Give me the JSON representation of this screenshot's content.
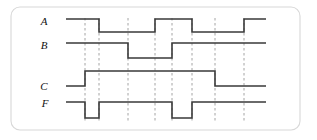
{
  "figure": {
    "frame": {
      "x": 11,
      "y": 7,
      "width": 289,
      "height": 123,
      "radius": 9,
      "border_color": "#d8d8d8",
      "fill": "#ffffff"
    },
    "waveform_color": "#3a3a3a",
    "marker_color": "#9a9a9a",
    "label_color": "#111111",
    "time_start": 66,
    "time_end": 266
  },
  "chart_data": {
    "type": "line",
    "xlabel": "time",
    "ylabel": "",
    "grid": "vertical-dashed-markers",
    "legend_position": "left-labels",
    "marker_times": [
      85,
      99,
      128,
      155,
      172,
      192,
      215,
      244
    ],
    "marker_span_y": [
      18,
      122
    ],
    "signals": [
      {
        "name": "A",
        "label": "A",
        "label_x": 44,
        "label_y": 25,
        "high_y": 19,
        "low_y": 32,
        "initial_level": 1,
        "transitions": [
          {
            "t": 99,
            "level": 0
          },
          {
            "t": 155,
            "level": 1
          },
          {
            "t": 192,
            "level": 0
          },
          {
            "t": 244,
            "level": 1
          }
        ],
        "levels_sequence": [
          1,
          0,
          1,
          0,
          1
        ]
      },
      {
        "name": "B",
        "label": "B",
        "label_x": 44,
        "label_y": 49,
        "high_y": 43,
        "low_y": 58,
        "initial_level": 1,
        "transitions": [
          {
            "t": 128,
            "level": 0
          },
          {
            "t": 172,
            "level": 1
          }
        ],
        "levels_sequence": [
          1,
          0,
          1
        ]
      },
      {
        "name": "C",
        "label": "C",
        "label_x": 44,
        "label_y": 90,
        "high_y": 71,
        "low_y": 86,
        "initial_level": 0,
        "transitions": [
          {
            "t": 85,
            "level": 1
          },
          {
            "t": 215,
            "level": 0
          }
        ],
        "levels_sequence": [
          0,
          1,
          0
        ]
      },
      {
        "name": "F",
        "label": "F",
        "label_x": 45,
        "label_y": 107,
        "high_y": 102,
        "low_y": 118,
        "initial_level": 1,
        "transitions": [
          {
            "t": 85,
            "level": 0
          },
          {
            "t": 99,
            "level": 1
          },
          {
            "t": 172,
            "level": 0
          },
          {
            "t": 192,
            "level": 1
          }
        ],
        "levels_sequence": [
          1,
          0,
          1,
          0,
          1
        ]
      }
    ]
  }
}
